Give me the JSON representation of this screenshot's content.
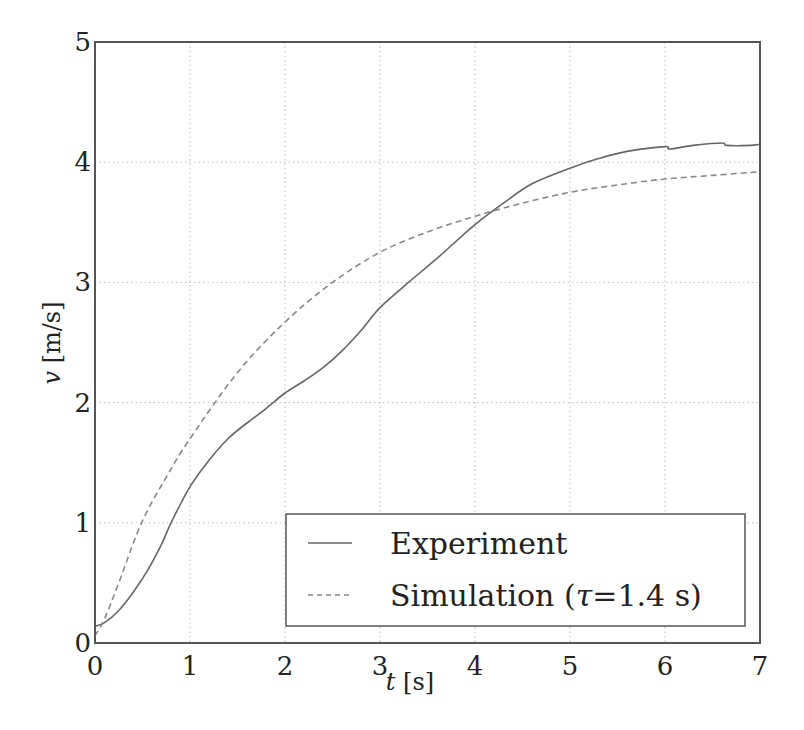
{
  "chart_data": {
    "type": "line",
    "title": "",
    "xlabel": "t [s]",
    "ylabel": "v [m/s]",
    "xlim": [
      0,
      7
    ],
    "ylim": [
      0,
      5
    ],
    "xticks": [
      0,
      1,
      2,
      3,
      4,
      5,
      6,
      7
    ],
    "yticks": [
      0,
      1,
      2,
      3,
      4,
      5
    ],
    "grid": true,
    "legend_position": "lower right",
    "series": [
      {
        "name": "Experiment",
        "style": "solid",
        "color": "#666666",
        "x": [
          0,
          0.1,
          0.25,
          0.4,
          0.55,
          0.7,
          0.8,
          1.0,
          1.2,
          1.4,
          1.6,
          1.8,
          2.0,
          2.2,
          2.4,
          2.6,
          2.8,
          3.0,
          3.3,
          3.6,
          4.0,
          4.3,
          4.6,
          5.0,
          5.3,
          5.6,
          6.0,
          6.05,
          6.3,
          6.6,
          6.65,
          6.9,
          7.0
        ],
        "y": [
          0.14,
          0.17,
          0.27,
          0.42,
          0.6,
          0.82,
          1.0,
          1.3,
          1.52,
          1.7,
          1.83,
          1.95,
          2.08,
          2.18,
          2.29,
          2.43,
          2.6,
          2.79,
          3.0,
          3.2,
          3.48,
          3.66,
          3.82,
          3.95,
          4.03,
          4.09,
          4.13,
          4.11,
          4.14,
          4.16,
          4.14,
          4.14,
          4.15
        ]
      },
      {
        "name": "Simulation (τ=1.4 s)",
        "style": "dashed",
        "color": "#888888",
        "x": [
          0,
          0.1,
          0.25,
          0.49,
          0.75,
          1.0,
          1.5,
          2.0,
          2.5,
          3.0,
          3.5,
          4.0,
          4.5,
          5.0,
          5.5,
          6.0,
          6.5,
          7.0
        ],
        "y": [
          0.06,
          0.2,
          0.5,
          1.0,
          1.38,
          1.7,
          2.25,
          2.67,
          3.0,
          3.25,
          3.42,
          3.55,
          3.66,
          3.75,
          3.81,
          3.86,
          3.89,
          3.92
        ]
      }
    ]
  },
  "legend": {
    "items": [
      {
        "label": "Experiment",
        "style": "solid"
      },
      {
        "label_prefix": "Simulation (",
        "label_tau": "τ",
        "label_suffix": "=1.4 s)",
        "style": "dashed"
      }
    ]
  },
  "axes": {
    "xlabel_var": "t",
    "xlabel_unit": " [s]",
    "ylabel_var": "v",
    "ylabel_unit": " [m/s]",
    "xtick_labels": [
      "0",
      "1",
      "2",
      "3",
      "4",
      "5",
      "6",
      "7"
    ],
    "ytick_labels": [
      "0",
      "1",
      "2",
      "3",
      "4",
      "5"
    ]
  },
  "colors": {
    "axis": "#555555",
    "grid": "#bbbbbb",
    "experiment": "#666666",
    "simulation": "#888888"
  }
}
